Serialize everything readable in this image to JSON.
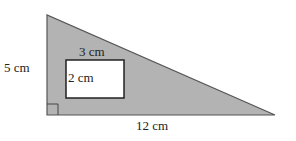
{
  "diagram": {
    "shape": "right triangle with rectangular hole",
    "triangle": {
      "height_label": "5 cm",
      "base_label": "12 cm",
      "fill": "#b3b3b3",
      "stroke": "#444444"
    },
    "rectangle": {
      "width_label": "3 cm",
      "height_label": "2 cm",
      "fill": "#ffffff",
      "stroke": "#222222"
    },
    "right_angle_marker": true
  }
}
